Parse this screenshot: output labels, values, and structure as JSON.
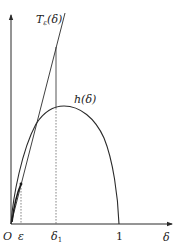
{
  "figure": {
    "type": "function-plot-diagram",
    "colors": {
      "stroke": "#2a2a2a",
      "dashed": "#555555",
      "background": "#ffffff"
    },
    "axes": {
      "x_label": "δ",
      "origin_label": "O",
      "x_ticks": [
        {
          "label": "ε",
          "position": "epsilon"
        },
        {
          "label": "δ",
          "subscript": "1",
          "position": "delta1"
        },
        {
          "label": "1",
          "position": "one"
        }
      ]
    },
    "curves": [
      {
        "name": "tangent-line",
        "label_main": "T",
        "label_sub": "ε",
        "label_arg": "(δ)",
        "kind": "straight line through origin"
      },
      {
        "name": "h-curve",
        "label": "h(δ)",
        "kind": "concave arc from O to 1"
      }
    ],
    "guides": [
      {
        "name": "epsilon-guide",
        "style": "dashed",
        "from": "ε on axis",
        "to": "tangency point"
      },
      {
        "name": "delta1-guide",
        "style": "solid above peak, dashed below",
        "from": "tangent line",
        "to": "δ1 on axis"
      }
    ]
  }
}
